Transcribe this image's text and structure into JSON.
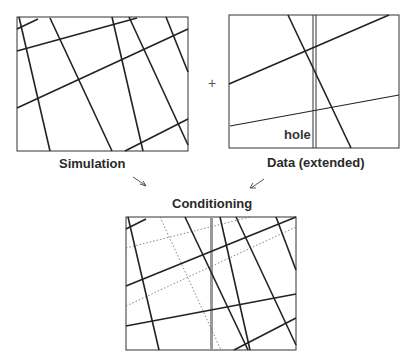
{
  "diagram": {
    "operator": "+",
    "panels": [
      {
        "id": "simulation",
        "label": "Simulation",
        "box": [
          17,
          17,
          188,
          151
        ]
      },
      {
        "id": "data",
        "label": "Data (extended)",
        "box": [
          229,
          15,
          399,
          148
        ],
        "annotation": "hole"
      },
      {
        "id": "conditioning",
        "label": "Conditioning",
        "box": [
          126,
          217,
          296,
          350
        ]
      }
    ],
    "arrows": [
      {
        "from": "simulation",
        "to": "conditioning",
        "direction": "down-right"
      },
      {
        "from": "data",
        "to": "conditioning",
        "direction": "down-left"
      }
    ],
    "legend_styles": {
      "fracture_solid": "#222222",
      "fracture_dotted": "#777777",
      "hole_band": "#9a9a9a"
    }
  }
}
